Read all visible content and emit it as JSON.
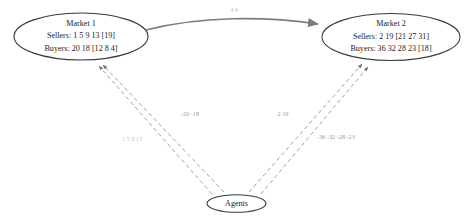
{
  "diagram": {
    "nodes": {
      "market1": {
        "title": "Market 1",
        "sellers": "Sellers: 1 5 9 13 [19]",
        "buyers": "Buyers: 20 18 [12 8 4]"
      },
      "market2": {
        "title": "Market 2",
        "sellers": "Sellers: 2 19 [21 27 31]",
        "buyers": "Buyers: 36 32 28 23 [18]"
      },
      "agents": {
        "title": "Agents"
      }
    },
    "edges": {
      "market1_to_market2": {
        "label": "4 4",
        "style": "solid"
      },
      "agents_to_market1_a": {
        "label": "1 5 9 13",
        "style": "dashed"
      },
      "agents_to_market1_b": {
        "label": "-20 -18",
        "style": "dashed"
      },
      "agents_to_market2_a": {
        "label": "2 19",
        "style": "dashed"
      },
      "agents_to_market2_b": {
        "label": "-36 -32 -28 -23",
        "style": "dashed"
      }
    },
    "colors": {
      "node_stroke": "#3a3a3a",
      "solid_edge": "#7c7c7c",
      "dashed_edge": "#8e8e9e",
      "text": "#1c1c1c",
      "label_text": "#9a9aa8",
      "background": "#ffffff"
    }
  }
}
